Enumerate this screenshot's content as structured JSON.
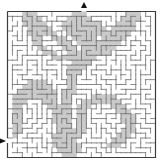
{
  "puzzle": {
    "title": "Maze",
    "type": "maze",
    "grid": {
      "cols": 30,
      "rows": 30
    },
    "frame": {
      "x": 7.5,
      "y": 11.5,
      "width": 148,
      "height": 146
    },
    "colors": {
      "background": "#ffffff",
      "wall": "#6e6e6e",
      "frame": "#3c3c3c",
      "shade": "#c9c9c9",
      "arrow": "#111111"
    },
    "entrances": [
      {
        "label": "top-entrance",
        "direction": "down",
        "x": 84,
        "y": 5
      },
      {
        "label": "left-entrance",
        "direction": "right",
        "x": 3,
        "y": 141
      }
    ],
    "shaded_regions": [
      {
        "name": "upper-left-leaf",
        "cells": [
          [
            3,
            0
          ],
          [
            4,
            0
          ],
          [
            5,
            0
          ],
          [
            3,
            1
          ],
          [
            4,
            1
          ],
          [
            5,
            1
          ],
          [
            6,
            1
          ],
          [
            3,
            2
          ],
          [
            4,
            2
          ],
          [
            5,
            2
          ],
          [
            6,
            2
          ],
          [
            7,
            2
          ],
          [
            4,
            3
          ],
          [
            5,
            3
          ],
          [
            6,
            3
          ],
          [
            7,
            3
          ],
          [
            8,
            3
          ],
          [
            4,
            4
          ],
          [
            5,
            4
          ],
          [
            6,
            4
          ],
          [
            7,
            4
          ],
          [
            8,
            4
          ],
          [
            9,
            4
          ],
          [
            5,
            5
          ],
          [
            6,
            5
          ],
          [
            9,
            5
          ],
          [
            10,
            5
          ],
          [
            11,
            5
          ],
          [
            5,
            6
          ],
          [
            6,
            6
          ],
          [
            10,
            6
          ],
          [
            11,
            6
          ],
          [
            12,
            6
          ],
          [
            6,
            7
          ],
          [
            7,
            7
          ],
          [
            11,
            7
          ],
          [
            12,
            7
          ],
          [
            13,
            7
          ],
          [
            7,
            8
          ],
          [
            8,
            8
          ],
          [
            9,
            8
          ],
          [
            12,
            8
          ],
          [
            13,
            8
          ],
          [
            14,
            8
          ],
          [
            9,
            9
          ],
          [
            10,
            9
          ],
          [
            11,
            9
          ],
          [
            12,
            9
          ],
          [
            13,
            9
          ],
          [
            14,
            9
          ]
        ]
      },
      {
        "name": "top-stem",
        "cells": [
          [
            13,
            0
          ],
          [
            14,
            0
          ],
          [
            15,
            0
          ],
          [
            12,
            1
          ],
          [
            13,
            1
          ],
          [
            14,
            1
          ],
          [
            15,
            1
          ],
          [
            16,
            1
          ],
          [
            11,
            2
          ],
          [
            12,
            2
          ],
          [
            13,
            2
          ],
          [
            14,
            2
          ],
          [
            15,
            2
          ],
          [
            16,
            2
          ],
          [
            17,
            2
          ],
          [
            18,
            2
          ],
          [
            11,
            3
          ],
          [
            12,
            3
          ],
          [
            13,
            3
          ],
          [
            14,
            3
          ],
          [
            15,
            3
          ],
          [
            16,
            3
          ],
          [
            17,
            3
          ],
          [
            18,
            3
          ],
          [
            19,
            3
          ],
          [
            12,
            4
          ],
          [
            13,
            4
          ],
          [
            14,
            4
          ],
          [
            15,
            4
          ],
          [
            16,
            4
          ],
          [
            17,
            4
          ],
          [
            18,
            4
          ],
          [
            13,
            5
          ],
          [
            14,
            5
          ],
          [
            15,
            5
          ],
          [
            16,
            5
          ],
          [
            17,
            5
          ],
          [
            14,
            6
          ],
          [
            15,
            6
          ],
          [
            16,
            6
          ],
          [
            17,
            6
          ],
          [
            18,
            6
          ],
          [
            15,
            7
          ],
          [
            16,
            7
          ],
          [
            17,
            7
          ],
          [
            18,
            7
          ],
          [
            15,
            8
          ],
          [
            16,
            8
          ],
          [
            17,
            8
          ],
          [
            18,
            8
          ],
          [
            15,
            9
          ],
          [
            16,
            9
          ],
          [
            17,
            9
          ],
          [
            13,
            10
          ],
          [
            14,
            10
          ],
          [
            15,
            10
          ],
          [
            16,
            10
          ],
          [
            12,
            11
          ],
          [
            13,
            11
          ],
          [
            14,
            11
          ],
          [
            15,
            11
          ],
          [
            12,
            12
          ],
          [
            13,
            12
          ],
          [
            14,
            12
          ]
        ]
      },
      {
        "name": "upper-right-leaf",
        "cells": [
          [
            24,
            0
          ],
          [
            25,
            0
          ],
          [
            26,
            0
          ],
          [
            23,
            1
          ],
          [
            24,
            1
          ],
          [
            25,
            1
          ],
          [
            26,
            1
          ],
          [
            22,
            2
          ],
          [
            23,
            2
          ],
          [
            24,
            2
          ],
          [
            25,
            2
          ],
          [
            21,
            3
          ],
          [
            22,
            3
          ],
          [
            23,
            3
          ],
          [
            24,
            3
          ],
          [
            25,
            3
          ],
          [
            19,
            4
          ],
          [
            20,
            4
          ],
          [
            21,
            4
          ],
          [
            22,
            4
          ],
          [
            23,
            4
          ],
          [
            24,
            4
          ],
          [
            19,
            5
          ],
          [
            20,
            5
          ],
          [
            21,
            5
          ],
          [
            22,
            5
          ],
          [
            23,
            5
          ],
          [
            19,
            6
          ],
          [
            20,
            6
          ],
          [
            21,
            6
          ],
          [
            22,
            6
          ],
          [
            19,
            7
          ],
          [
            20,
            7
          ],
          [
            21,
            7
          ],
          [
            19,
            8
          ],
          [
            20,
            8
          ]
        ]
      },
      {
        "name": "middle-stem",
        "cells": [
          [
            12,
            13
          ],
          [
            13,
            13
          ],
          [
            12,
            14
          ],
          [
            13,
            14
          ],
          [
            12,
            15
          ],
          [
            13,
            15
          ],
          [
            11,
            16
          ],
          [
            12,
            16
          ],
          [
            13,
            16
          ],
          [
            11,
            17
          ],
          [
            12,
            17
          ],
          [
            11,
            18
          ],
          [
            12,
            18
          ],
          [
            11,
            19
          ],
          [
            12,
            19
          ],
          [
            11,
            20
          ],
          [
            12,
            20
          ],
          [
            11,
            21
          ],
          [
            12,
            21
          ],
          [
            11,
            22
          ],
          [
            12,
            22
          ],
          [
            11,
            23
          ],
          [
            12,
            23
          ],
          [
            11,
            24
          ],
          [
            12,
            24
          ],
          [
            11,
            25
          ],
          [
            12,
            25
          ],
          [
            13,
            25
          ],
          [
            10,
            26
          ],
          [
            11,
            26
          ],
          [
            12,
            26
          ],
          [
            13,
            26
          ],
          [
            10,
            27
          ],
          [
            11,
            27
          ],
          [
            12,
            27
          ],
          [
            13,
            27
          ],
          [
            14,
            27
          ],
          [
            10,
            28
          ],
          [
            11,
            28
          ],
          [
            12,
            28
          ],
          [
            13,
            28
          ],
          [
            14,
            28
          ],
          [
            11,
            29
          ],
          [
            12,
            29
          ],
          [
            13,
            29
          ]
        ]
      },
      {
        "name": "lower-left-leaf",
        "cells": [
          [
            4,
            14
          ],
          [
            5,
            14
          ],
          [
            6,
            14
          ],
          [
            7,
            14
          ],
          [
            3,
            15
          ],
          [
            4,
            15
          ],
          [
            5,
            15
          ],
          [
            6,
            15
          ],
          [
            7,
            15
          ],
          [
            8,
            15
          ],
          [
            2,
            16
          ],
          [
            3,
            16
          ],
          [
            4,
            16
          ],
          [
            5,
            16
          ],
          [
            6,
            16
          ],
          [
            7,
            16
          ],
          [
            8,
            16
          ],
          [
            9,
            16
          ],
          [
            1,
            17
          ],
          [
            2,
            17
          ],
          [
            3,
            17
          ],
          [
            4,
            17
          ],
          [
            5,
            17
          ],
          [
            6,
            17
          ],
          [
            7,
            17
          ],
          [
            8,
            17
          ],
          [
            9,
            17
          ],
          [
            1,
            18
          ],
          [
            2,
            18
          ],
          [
            3,
            18
          ],
          [
            7,
            18
          ],
          [
            8,
            18
          ],
          [
            9,
            18
          ],
          [
            1,
            19
          ],
          [
            2,
            19
          ],
          [
            8,
            19
          ],
          [
            9,
            19
          ],
          [
            10,
            19
          ],
          [
            1,
            20
          ],
          [
            2,
            20
          ],
          [
            9,
            20
          ],
          [
            10,
            20
          ],
          [
            1,
            21
          ],
          [
            2,
            21
          ],
          [
            9,
            21
          ],
          [
            10,
            21
          ],
          [
            1,
            22
          ],
          [
            2,
            22
          ],
          [
            9,
            22
          ],
          [
            10,
            22
          ],
          [
            1,
            23
          ],
          [
            2,
            23
          ],
          [
            10,
            23
          ],
          [
            1,
            24
          ],
          [
            2,
            24
          ],
          [
            10,
            24
          ],
          [
            1,
            25
          ],
          [
            9,
            25
          ],
          [
            10,
            25
          ],
          [
            9,
            26
          ],
          [
            9,
            27
          ]
        ]
      },
      {
        "name": "lower-right-leaf",
        "cells": [
          [
            17,
            17
          ],
          [
            18,
            17
          ],
          [
            19,
            17
          ],
          [
            20,
            17
          ],
          [
            21,
            17
          ],
          [
            15,
            18
          ],
          [
            16,
            18
          ],
          [
            17,
            18
          ],
          [
            18,
            18
          ],
          [
            19,
            18
          ],
          [
            20,
            18
          ],
          [
            21,
            18
          ],
          [
            22,
            18
          ],
          [
            14,
            19
          ],
          [
            15,
            19
          ],
          [
            16,
            19
          ],
          [
            21,
            19
          ],
          [
            22,
            19
          ],
          [
            23,
            19
          ],
          [
            14,
            20
          ],
          [
            15,
            20
          ],
          [
            22,
            20
          ],
          [
            23,
            20
          ],
          [
            24,
            20
          ],
          [
            14,
            21
          ],
          [
            15,
            21
          ],
          [
            23,
            21
          ],
          [
            24,
            21
          ],
          [
            25,
            21
          ],
          [
            14,
            22
          ],
          [
            15,
            22
          ],
          [
            23,
            22
          ],
          [
            24,
            22
          ],
          [
            25,
            22
          ],
          [
            14,
            23
          ],
          [
            15,
            23
          ],
          [
            24,
            23
          ],
          [
            25,
            23
          ],
          [
            13,
            24
          ],
          [
            14,
            24
          ],
          [
            15,
            24
          ],
          [
            23,
            24
          ],
          [
            24,
            24
          ],
          [
            25,
            24
          ],
          [
            13,
            25
          ],
          [
            14,
            25
          ],
          [
            22,
            25
          ],
          [
            23,
            25
          ],
          [
            24,
            25
          ],
          [
            21,
            26
          ],
          [
            22,
            26
          ],
          [
            23,
            26
          ],
          [
            20,
            27
          ],
          [
            21,
            27
          ],
          [
            22,
            27
          ]
        ]
      }
    ],
    "maze_seed": 4217
  }
}
